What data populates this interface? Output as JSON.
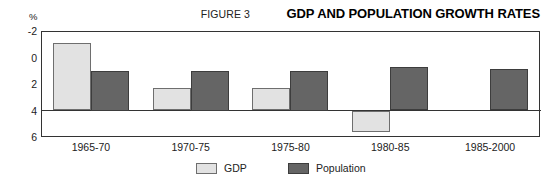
{
  "header": {
    "figure_number": "FIGURE 3",
    "title": "GDP AND POPULATION GROWTH RATES"
  },
  "axis": {
    "unit_label": "%",
    "y_ticks": [
      "6",
      "4",
      "2",
      "0",
      "-2"
    ]
  },
  "legend": {
    "items": [
      {
        "label": "GDP",
        "color": "#e2e2e2"
      },
      {
        "label": "Population",
        "color": "#656565"
      }
    ]
  },
  "chart_data": {
    "type": "bar",
    "title": "GDP AND POPULATION GROWTH RATES",
    "subtitle": "FIGURE 3",
    "xlabel": "",
    "ylabel": "%",
    "ylim": [
      -2,
      6
    ],
    "yticks": [
      -2,
      0,
      2,
      4,
      6
    ],
    "grid": false,
    "legend_position": "bottom-center",
    "categories": [
      "1965-70",
      "1970-75",
      "1975-80",
      "1980-85",
      "1985-2000"
    ],
    "series": [
      {
        "name": "GDP",
        "color": "#e2e2e2",
        "values": [
          5.1,
          1.7,
          1.7,
          -1.6,
          null
        ]
      },
      {
        "name": "Population",
        "color": "#656565",
        "values": [
          3.0,
          3.0,
          3.0,
          3.3,
          3.1
        ]
      }
    ]
  }
}
